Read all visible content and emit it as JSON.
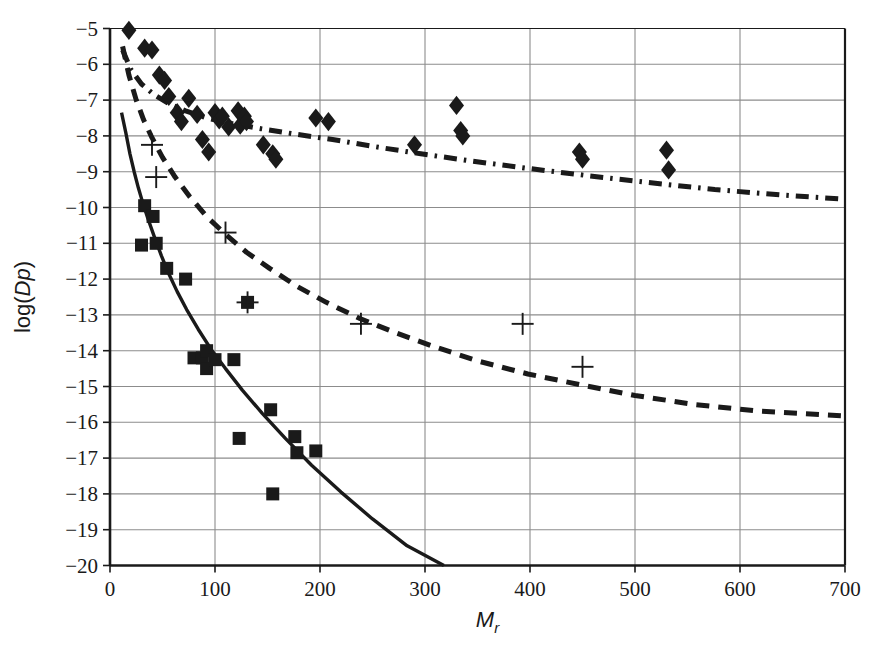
{
  "figure": {
    "background_color": "#ffffff",
    "ink_color": "#1a1a1a",
    "grid_color": "#8c8c8c",
    "axis_color": "#1a1a1a"
  },
  "chart_data": {
    "type": "scatter",
    "title": "",
    "xlabel": "Mr",
    "xlabel_parts": {
      "main": "M",
      "sub": "r"
    },
    "ylabel": "log(Dp)",
    "ylabel_parts": {
      "prefix": "log(",
      "italic1": "D",
      "italic2": "p",
      "suffix": ")"
    },
    "xlim": [
      0,
      700
    ],
    "ylim": [
      -20,
      -5
    ],
    "xticks": [
      0,
      100,
      200,
      300,
      400,
      500,
      600,
      700
    ],
    "xticklabels": [
      "0",
      "100",
      "200",
      "300",
      "400",
      "500",
      "600",
      "700"
    ],
    "yticks": [
      -20,
      -19,
      -18,
      -17,
      -16,
      -15,
      -14,
      -13,
      -12,
      -11,
      -10,
      -9,
      -8,
      -7,
      -6,
      -5
    ],
    "yticklabels": [
      "−20",
      "−19",
      "−18",
      "−17",
      "−16",
      "−15",
      "−14",
      "−13",
      "−12",
      "−11",
      "−10",
      "−9",
      "−8",
      "−7",
      "−6",
      "−5"
    ],
    "grid": true,
    "grid_x": true,
    "grid_y": true,
    "legend": "none",
    "series": [
      {
        "name": "diamond-markers",
        "marker": "diamond",
        "marker_size": 15,
        "color": "#1a1a1a",
        "points": [
          [
            18,
            -5.05
          ],
          [
            33,
            -5.55
          ],
          [
            40,
            -5.6
          ],
          [
            47,
            -6.3
          ],
          [
            52,
            -6.45
          ],
          [
            56,
            -6.9
          ],
          [
            64,
            -7.35
          ],
          [
            68,
            -7.6
          ],
          [
            75,
            -6.95
          ],
          [
            83,
            -7.4
          ],
          [
            88,
            -8.1
          ],
          [
            94,
            -8.45
          ],
          [
            100,
            -7.35
          ],
          [
            104,
            -7.55
          ],
          [
            107,
            -7.45
          ],
          [
            113,
            -7.75
          ],
          [
            122,
            -7.3
          ],
          [
            124,
            -7.7
          ],
          [
            128,
            -7.45
          ],
          [
            130,
            -7.6
          ],
          [
            146,
            -8.25
          ],
          [
            155,
            -8.5
          ],
          [
            158,
            -8.65
          ],
          [
            196,
            -7.5
          ],
          [
            208,
            -7.6
          ],
          [
            290,
            -8.25
          ],
          [
            330,
            -7.15
          ],
          [
            334,
            -7.85
          ],
          [
            336,
            -8.0
          ],
          [
            447,
            -8.45
          ],
          [
            450,
            -8.65
          ],
          [
            530,
            -8.4
          ],
          [
            532,
            -8.95
          ]
        ]
      },
      {
        "name": "square-markers",
        "marker": "square",
        "marker_size": 13,
        "color": "#1a1a1a",
        "points": [
          [
            33,
            -9.95
          ],
          [
            41,
            -10.25
          ],
          [
            30,
            -11.05
          ],
          [
            44,
            -11.0
          ],
          [
            54,
            -11.7
          ],
          [
            72,
            -12.0
          ],
          [
            80,
            -14.2
          ],
          [
            88,
            -14.2
          ],
          [
            92,
            -14.0
          ],
          [
            92,
            -14.5
          ],
          [
            100,
            -14.25
          ],
          [
            118,
            -14.25
          ],
          [
            131,
            -12.65
          ],
          [
            123,
            -16.45
          ],
          [
            153,
            -15.65
          ],
          [
            176,
            -16.4
          ],
          [
            178,
            -16.85
          ],
          [
            196,
            -16.8
          ],
          [
            155,
            -18.0
          ]
        ]
      },
      {
        "name": "plus-markers",
        "marker": "plus",
        "marker_size": 22,
        "color": "#1a1a1a",
        "points": [
          [
            40,
            -8.25
          ],
          [
            44,
            -9.15
          ],
          [
            110,
            -10.7
          ],
          [
            131,
            -12.65
          ],
          [
            239,
            -13.25
          ],
          [
            393,
            -13.25
          ],
          [
            450,
            -14.45
          ]
        ]
      }
    ],
    "curves": [
      {
        "name": "solid-curve",
        "style": "solid",
        "linewidth": 3.4,
        "color": "#1a1a1a",
        "points": [
          [
            11,
            -7.35
          ],
          [
            15,
            -7.9
          ],
          [
            19,
            -8.5
          ],
          [
            23,
            -9.0
          ],
          [
            27,
            -9.45
          ],
          [
            31,
            -9.85
          ],
          [
            36,
            -10.3
          ],
          [
            42,
            -10.8
          ],
          [
            49,
            -11.35
          ],
          [
            56,
            -11.85
          ],
          [
            64,
            -12.35
          ],
          [
            73,
            -12.85
          ],
          [
            84,
            -13.4
          ],
          [
            96,
            -13.95
          ],
          [
            110,
            -14.5
          ],
          [
            126,
            -15.1
          ],
          [
            145,
            -15.75
          ],
          [
            167,
            -16.45
          ],
          [
            192,
            -17.2
          ],
          [
            220,
            -17.95
          ],
          [
            250,
            -18.7
          ],
          [
            283,
            -19.45
          ],
          [
            318,
            -20.0
          ]
        ]
      },
      {
        "name": "dashed-curve",
        "style": "dashed",
        "linewidth": 5,
        "dash": "13,9",
        "color": "#1a1a1a",
        "points": [
          [
            12,
            -5.5
          ],
          [
            18,
            -6.3
          ],
          [
            25,
            -7.0
          ],
          [
            32,
            -7.55
          ],
          [
            40,
            -8.05
          ],
          [
            50,
            -8.6
          ],
          [
            62,
            -9.15
          ],
          [
            76,
            -9.7
          ],
          [
            92,
            -10.25
          ],
          [
            110,
            -10.75
          ],
          [
            130,
            -11.25
          ],
          [
            152,
            -11.7
          ],
          [
            178,
            -12.2
          ],
          [
            206,
            -12.65
          ],
          [
            238,
            -13.1
          ],
          [
            272,
            -13.5
          ],
          [
            310,
            -13.9
          ],
          [
            352,
            -14.3
          ],
          [
            398,
            -14.65
          ],
          [
            448,
            -14.95
          ],
          [
            500,
            -15.25
          ],
          [
            556,
            -15.5
          ],
          [
            615,
            -15.68
          ],
          [
            700,
            -15.82
          ]
        ]
      },
      {
        "name": "dash-dot-curve",
        "style": "dashdot",
        "linewidth": 5,
        "dash": "13,7,2.5,7",
        "color": "#1a1a1a",
        "points": [
          [
            12,
            -5.6
          ],
          [
            20,
            -6.15
          ],
          [
            30,
            -6.55
          ],
          [
            42,
            -6.85
          ],
          [
            56,
            -7.1
          ],
          [
            72,
            -7.3
          ],
          [
            92,
            -7.5
          ],
          [
            116,
            -7.65
          ],
          [
            144,
            -7.8
          ],
          [
            176,
            -7.95
          ],
          [
            212,
            -8.1
          ],
          [
            252,
            -8.3
          ],
          [
            296,
            -8.5
          ],
          [
            344,
            -8.7
          ],
          [
            396,
            -8.9
          ],
          [
            452,
            -9.1
          ],
          [
            512,
            -9.3
          ],
          [
            576,
            -9.5
          ],
          [
            640,
            -9.65
          ],
          [
            700,
            -9.77
          ]
        ]
      }
    ]
  }
}
